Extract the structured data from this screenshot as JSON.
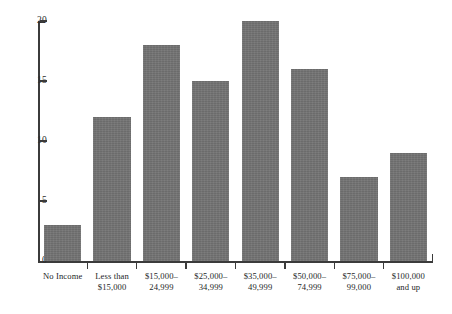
{
  "chart_data": {
    "type": "bar",
    "title": "",
    "subtitle": "",
    "xlabel": "",
    "ylabel": "",
    "categories": [
      "No Income",
      "Less than\n$15,000",
      "$15,000–\n24,999",
      "$25,000–\n34,999",
      "$35,000–\n49,999",
      "$50,000–\n74,999",
      "$75,000–\n99,000",
      "$100,000\nand up"
    ],
    "values": [
      3,
      12,
      18,
      15,
      20,
      16,
      7,
      9
    ],
    "ylim": [
      0,
      20
    ],
    "ytick_labels": [
      "0",
      "5",
      "10",
      "15",
      "20"
    ],
    "ytick_values": [
      0,
      5,
      10,
      15,
      20
    ],
    "grid": false,
    "legend": "none",
    "bar_color": "#737373",
    "axis_color": "#3b3b3b",
    "background_color": "#ffffff"
  }
}
